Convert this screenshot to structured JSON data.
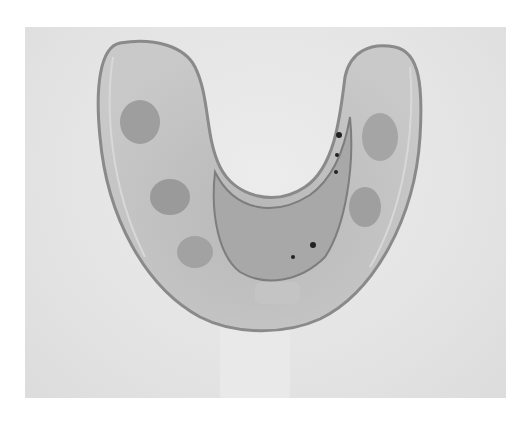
{
  "image": {
    "description": "Grayscale photograph of a clear dental tray / mouthguard (U-shaped) on a light background",
    "colors": {
      "background": "#e4e4e4",
      "tray_fill": "#bdbdbd",
      "tray_edge": "#8a8a8a",
      "inner_arch": "#a8a8a8",
      "dark_spots": "#222222"
    }
  }
}
